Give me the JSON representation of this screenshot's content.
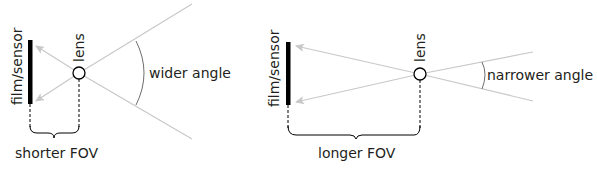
{
  "left_diagram": {
    "sensor_label": "film/sensor",
    "lens_label": "lens",
    "angle_label": "wider angle",
    "fov_label": "shorter FOV"
  },
  "right_diagram": {
    "sensor_label": "film/sensor",
    "lens_label": "lens",
    "angle_label": "narrower angle",
    "fov_label": "longer FOV"
  },
  "colors": {
    "ray": "#c8c8c8",
    "ink": "#000000",
    "text": "#231f20",
    "arc": "#6d6e70"
  }
}
